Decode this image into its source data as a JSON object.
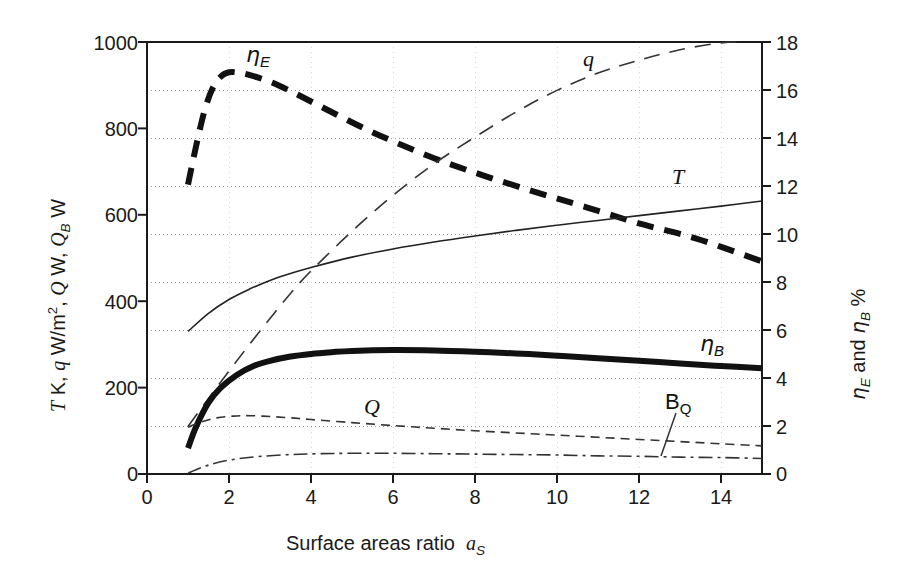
{
  "chart_data": {
    "type": "line",
    "title": "",
    "xlabel": "Surface areas ratio",
    "xlabel_symbol": "a",
    "xlabel_symbol_sub": "S",
    "ylabel_left_parts": [
      "T",
      " K, ",
      "q",
      " W/m",
      "2",
      ", ",
      "Q",
      " W,  ",
      "Q",
      "B",
      " W"
    ],
    "ylabel_left": "T K, q W/m2, Q W, QB W",
    "ylabel_right": "ηE and ηB  %",
    "xlim": [
      0,
      15
    ],
    "ylim_left": [
      0,
      1000
    ],
    "ylim_right": [
      0,
      18
    ],
    "xticks": [
      0,
      2,
      4,
      6,
      8,
      10,
      12,
      14
    ],
    "yticks_left": [
      0,
      200,
      400,
      600,
      800,
      1000
    ],
    "yticks_right": [
      0,
      2,
      4,
      6,
      8,
      10,
      12,
      14,
      16,
      18
    ],
    "gridlines_right": [
      2,
      4,
      6,
      8,
      10,
      12,
      14,
      16
    ],
    "grid": "dotted horizontal (right axis odd-scale), faint vertical",
    "legend": "inline curve labels",
    "legend_position": "inline",
    "series": [
      {
        "name": "eta_E",
        "label": "ηE",
        "axis": "right",
        "style": "heavy-dashed",
        "color": "#111111",
        "width": 6,
        "dash": "17,11",
        "x": [
          1.0,
          1.2,
          1.4,
          1.6,
          1.8,
          2.0,
          2.3,
          2.7,
          3.2,
          3.8,
          4.5,
          5.3,
          6.2,
          7.2,
          8.3,
          9.5,
          10.7,
          12.0,
          13.4,
          15.0
        ],
        "y_left": [
          670,
          760,
          840,
          893,
          920,
          930,
          928,
          918,
          900,
          872,
          838,
          800,
          762,
          724,
          688,
          652,
          618,
          580,
          545,
          492
        ],
        "y_right": [
          12.06,
          13.68,
          15.12,
          16.07,
          16.56,
          16.74,
          16.7,
          16.52,
          16.2,
          15.7,
          15.08,
          14.4,
          13.72,
          13.03,
          12.38,
          11.74,
          11.12,
          10.44,
          9.81,
          8.86
        ]
      },
      {
        "name": "q",
        "label": "q",
        "axis": "left",
        "style": "long-dashed-thin",
        "color": "#333333",
        "width": 1.6,
        "dash": "16,10",
        "x": [
          1.0,
          1.5,
          2.0,
          2.5,
          3.0,
          3.5,
          4.0,
          5.0,
          6.0,
          7.0,
          8.0,
          9.0,
          10.0,
          11.0,
          12.0,
          13.0,
          14.0,
          14.6
        ],
        "y_left": [
          110,
          175,
          238,
          300,
          360,
          418,
          470,
          562,
          645,
          718,
          780,
          838,
          888,
          928,
          958,
          982,
          998,
          1000
        ]
      },
      {
        "name": "T",
        "label": "T",
        "axis": "left",
        "style": "solid-thin",
        "color": "#222222",
        "width": 1.6,
        "dash": "none",
        "x": [
          1.0,
          1.5,
          2.0,
          2.5,
          3.0,
          3.5,
          4.0,
          5.0,
          6.0,
          7.0,
          8.0,
          9.0,
          10.0,
          11.0,
          12.0,
          13.0,
          14.0,
          15.0
        ],
        "y_left": [
          330,
          372,
          404,
          428,
          448,
          464,
          478,
          502,
          521,
          537,
          551,
          564,
          576,
          587,
          598,
          609,
          620,
          632
        ]
      },
      {
        "name": "eta_B",
        "label": "ηB",
        "axis": "right",
        "style": "heavy-solid",
        "color": "#111111",
        "width": 6,
        "dash": "none",
        "x": [
          1.0,
          1.2,
          1.5,
          1.8,
          2.2,
          2.6,
          3.0,
          3.5,
          4.0,
          4.5,
          5.0,
          6.0,
          7.0,
          8.0,
          9.0,
          10.0,
          11.0,
          12.0,
          13.0,
          14.0,
          15.0
        ],
        "y_left": [
          60,
          110,
          165,
          200,
          230,
          250,
          262,
          272,
          278,
          282,
          285,
          287,
          286,
          283,
          279,
          274,
          268,
          262,
          256,
          250,
          245
        ],
        "y_right": [
          1.08,
          1.98,
          2.97,
          3.6,
          4.14,
          4.5,
          4.72,
          4.9,
          5.0,
          5.08,
          5.13,
          5.17,
          5.15,
          5.09,
          5.02,
          4.93,
          4.82,
          4.72,
          4.61,
          4.5,
          4.41
        ]
      },
      {
        "name": "Q",
        "label": "Q",
        "axis": "left",
        "style": "dashed-thin",
        "color": "#333333",
        "width": 1.6,
        "dash": "9,6",
        "x": [
          1.0,
          1.3,
          1.7,
          2.1,
          2.5,
          3.0,
          3.5,
          4.0,
          5.0,
          6.0,
          7.0,
          8.0,
          9.0,
          10.0,
          11.0,
          12.0,
          13.0,
          14.0,
          15.0
        ],
        "y_left": [
          108,
          120,
          130,
          134,
          135,
          133,
          130,
          126,
          119,
          112,
          106,
          100,
          95,
          90,
          85,
          80,
          75,
          70,
          65
        ]
      },
      {
        "name": "B_Q",
        "label": "BQ",
        "axis": "left",
        "style": "dash-dot-thin",
        "color": "#333333",
        "width": 1.6,
        "dash": "14,5,3,5",
        "x": [
          1.0,
          1.3,
          1.7,
          2.2,
          2.8,
          3.5,
          4.2,
          5.0,
          6.0,
          7.0,
          8.0,
          9.0,
          10.0,
          11.0,
          12.0,
          13.0,
          14.0,
          15.0
        ],
        "y_left": [
          2,
          14,
          26,
          35,
          41,
          45,
          47,
          48,
          48,
          47,
          46,
          45,
          44,
          42,
          41,
          39,
          38,
          36
        ]
      }
    ],
    "annotations": [
      {
        "name": "eta-E-label",
        "text": "ηE",
        "x_px": 246,
        "y_px": 47
      },
      {
        "name": "q-label",
        "text": "q",
        "x_px": 583,
        "y_px": 50
      },
      {
        "name": "T-label",
        "text": "T",
        "x_px": 672,
        "y_px": 168
      },
      {
        "name": "eta-B-label",
        "text": "ηB",
        "x_px": 702,
        "y_px": 336
      },
      {
        "name": "Q-label",
        "text": "Q",
        "x_px": 366,
        "y_px": 398
      },
      {
        "name": "B-Q-label",
        "text": "BQ",
        "x_px": 668,
        "y_px": 394
      }
    ]
  },
  "axes": {
    "left_ticks": [
      "1000",
      "800",
      "600",
      "400",
      "200",
      "0"
    ],
    "right_ticks": [
      "18",
      "16",
      "14",
      "12",
      "10",
      "8",
      "6",
      "4",
      "2",
      "0"
    ],
    "bottom_ticks": [
      "0",
      "2",
      "4",
      "6",
      "8",
      "10",
      "12",
      "14"
    ],
    "x_title_text": "Surface areas ratio",
    "x_title_symbol": "a",
    "x_title_symbol_sub": "S",
    "left_title_segments": {
      "t": "T",
      "k": " K, ",
      "q": "q",
      "wm": " W/m",
      "sup2": "2",
      "comma": ", ",
      "bigq": "Q",
      "w1": " W,  ",
      "qb": "Q",
      "qb_sub": "B",
      "w2": " W"
    },
    "right_title_segments": {
      "eta1": "η",
      "eta1_sub": "E",
      "and": " and ",
      "eta2": "η",
      "eta2_sub": "B",
      "percent": "  %"
    }
  },
  "curve_labels": {
    "eta_E": "η",
    "eta_E_sub": "E",
    "q": "q",
    "T": "T",
    "eta_B": "η",
    "eta_B_sub": "B",
    "Q": "Q",
    "B": "B",
    "B_sub": "Q"
  },
  "colors": {
    "axis": "#1a1a1a",
    "grid": "#9a9a9a",
    "heavy_curve": "#111111",
    "thin_curve": "#333333",
    "background": "#ffffff"
  }
}
